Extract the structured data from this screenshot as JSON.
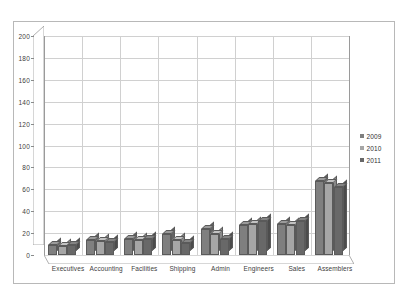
{
  "chart_data": {
    "type": "bar",
    "title": "",
    "subtitle": "",
    "xlabel": "",
    "ylabel": "",
    "categories": [
      "Executives",
      "Accounting",
      "Facilities",
      "Shipping",
      "Admin",
      "Engineers",
      "Sales",
      "Assemblers"
    ],
    "series": [
      {
        "name": "2009",
        "color": "#7f7f7f",
        "values": [
          9,
          14,
          15,
          19,
          24,
          27,
          28,
          68
        ]
      },
      {
        "name": "2010",
        "color": "#a6a6a6",
        "values": [
          8,
          13,
          14,
          14,
          19,
          28,
          27,
          66
        ]
      },
      {
        "name": "2011",
        "color": "#686868",
        "values": [
          9,
          12,
          15,
          11,
          15,
          31,
          31,
          62
        ]
      }
    ],
    "ylim": [
      0,
      200
    ],
    "yticks": [
      0,
      20,
      40,
      60,
      80,
      100,
      120,
      140,
      160,
      180,
      200
    ],
    "ytick_labels": [
      "0",
      "20",
      "40",
      "60",
      "80",
      "100",
      "120",
      "140",
      "160",
      "180",
      "200"
    ],
    "grid": true,
    "legend_position": "right",
    "style": "3d-clustered-column",
    "plot_background": "#ffffff",
    "grid_color": "#d0d0d0",
    "axis_color": "#9a9a9a",
    "border_color": "#b8b8b8",
    "text_color": "#404040"
  }
}
